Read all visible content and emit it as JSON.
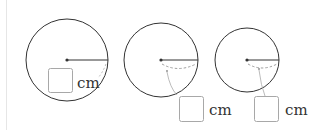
{
  "figure": {
    "colors": {
      "stroke": "#333333",
      "guide": "#9a9a9a",
      "box": "#a8a8a8",
      "margin_line": "#e6e6e6"
    },
    "circles": [
      {
        "id": "circle-1",
        "unit_label": "cm",
        "answer_blank": "",
        "radius_style": "solid-with-dashed-chord"
      },
      {
        "id": "circle-2",
        "unit_label": "cm",
        "answer_blank": "",
        "radius_style": "solid-with-dashed-arc"
      },
      {
        "id": "circle-3",
        "unit_label": "cm",
        "answer_blank": "",
        "radius_style": "solid-with-dashed-arc"
      }
    ]
  }
}
